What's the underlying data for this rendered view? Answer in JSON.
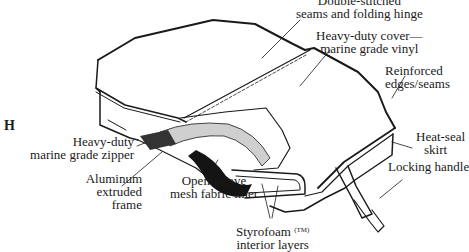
{
  "figure": {
    "letter": "H",
    "colors": {
      "ink": "#1a1a1a",
      "background": "#ffffff"
    }
  },
  "labels": {
    "seams": [
      "Double-stitched",
      "seams and folding hinge"
    ],
    "cover": [
      "Heavy-duty cover—",
      "marine grade vinyl"
    ],
    "edges": [
      "Reinforced",
      "edges/seams"
    ],
    "zipper": [
      "Heavy-duty",
      "marine grade zipper"
    ],
    "skirt": [
      "Heat-seal",
      "skirt"
    ],
    "handle": "Locking handle",
    "frame": [
      "Aluminum",
      "extruded",
      "frame"
    ],
    "liner": [
      "Open weave",
      "mesh fabric liner"
    ],
    "foam": [
      "Styrofoam",
      "(TM)",
      "interior layers"
    ]
  }
}
